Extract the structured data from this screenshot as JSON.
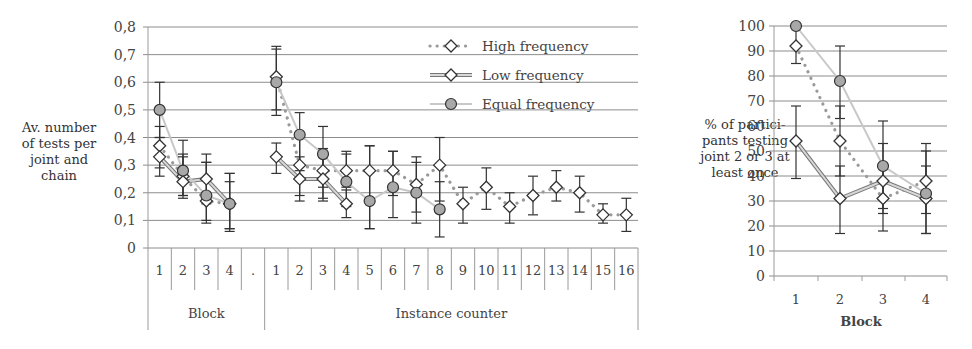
{
  "chart_data": [
    {
      "type": "line",
      "title": "",
      "ylabel": "Av. number of tests per joint and chain",
      "xlabel_groups": [
        "Block",
        "Instance counter"
      ],
      "ylim": [
        0,
        0.8
      ],
      "yticks": [
        "0",
        "0,1",
        "0,2",
        "0,3",
        "0,4",
        "0,5",
        "0,6",
        "0,7",
        "0,8"
      ],
      "categories": [
        "1",
        "2",
        "3",
        "4",
        ".",
        "1",
        "2",
        "3",
        "4",
        "5",
        "6",
        "7",
        "8",
        "9",
        "10",
        "11",
        "12",
        "13",
        "14",
        "15",
        "16"
      ],
      "grid": true,
      "legend_position": "top-right",
      "series": [
        {
          "name": "High frequency",
          "style": "dotted",
          "marker": "diamond",
          "values": [
            0.37,
            0.26,
            0.17,
            0.16,
            null,
            0.62,
            0.3,
            0.28,
            0.28,
            0.28,
            0.28,
            0.23,
            0.3,
            0.16,
            0.22,
            0.15,
            0.19,
            0.22,
            0.2,
            0.12,
            0.12
          ],
          "err_low": [
            0.29,
            0.19,
            0.1,
            0.07,
            null,
            0.5,
            0.19,
            0.22,
            0.22,
            0.07,
            0.19,
            0.13,
            0.17,
            0.09,
            0.14,
            0.09,
            0.12,
            0.17,
            0.13,
            0.09,
            0.06
          ],
          "err_high": [
            0.44,
            0.34,
            0.31,
            0.24,
            null,
            0.73,
            0.41,
            0.36,
            0.35,
            0.37,
            0.35,
            0.33,
            0.4,
            0.22,
            0.29,
            0.2,
            0.26,
            0.28,
            0.26,
            0.16,
            0.18
          ]
        },
        {
          "name": "Low frequency",
          "style": "double",
          "marker": "diamond",
          "values": [
            0.33,
            0.24,
            0.25,
            0.16,
            null,
            0.33,
            0.25,
            0.25,
            0.16
          ],
          "err_low": [
            0.26,
            0.18,
            0.16,
            0.07,
            null,
            0.27,
            0.17,
            0.17,
            0.11
          ],
          "err_high": [
            0.4,
            0.33,
            0.34,
            0.27,
            null,
            0.38,
            0.33,
            0.33,
            0.21
          ]
        },
        {
          "name": "Equal frequency",
          "style": "solid-light",
          "marker": "circle",
          "values": [
            0.5,
            0.28,
            0.19,
            0.16,
            null,
            0.6,
            0.41,
            0.34,
            0.24,
            0.17,
            0.22,
            0.2,
            0.14
          ],
          "err_low": [
            0.4,
            0.19,
            0.09,
            0.06,
            null,
            0.48,
            0.28,
            0.18,
            0.15,
            0.07,
            0.11,
            0.09,
            0.04
          ],
          "err_high": [
            0.6,
            0.39,
            0.31,
            0.27,
            null,
            0.72,
            0.49,
            0.44,
            0.34,
            0.37,
            0.35,
            0.31,
            0.24
          ]
        }
      ]
    },
    {
      "type": "line",
      "title": "",
      "ylabel": "% of partici- pants testing joint 2 or 3 at least once",
      "xlabel": "Block",
      "ylim": [
        0,
        100
      ],
      "yticks": [
        "0",
        "10",
        "20",
        "30",
        "40",
        "50",
        "60",
        "70",
        "80",
        "90",
        "100"
      ],
      "categories": [
        "1",
        "2",
        "3",
        "4"
      ],
      "grid": true,
      "series": [
        {
          "name": "High frequency",
          "style": "dotted",
          "marker": "diamond",
          "values": [
            92,
            54,
            31,
            38
          ],
          "err_low": [
            85,
            40,
            18,
            25
          ],
          "err_high": [
            100,
            68,
            45,
            53
          ]
        },
        {
          "name": "Low frequency",
          "style": "double",
          "marker": "diamond",
          "values": [
            54,
            31,
            38,
            31
          ],
          "err_low": [
            39,
            17,
            25,
            17
          ],
          "err_high": [
            68,
            44,
            53,
            44
          ]
        },
        {
          "name": "Equal frequency",
          "style": "solid-light",
          "marker": "circle",
          "values": [
            100,
            78,
            44,
            33
          ],
          "err_low": [
            100,
            63,
            27,
            17
          ],
          "err_high": [
            100,
            92,
            62,
            50
          ]
        }
      ]
    }
  ],
  "left": {
    "ylabel_lines": [
      "Av. number",
      "of tests per",
      "joint and",
      "chain"
    ],
    "group_block": "Block",
    "group_instance": "Instance counter",
    "legend": [
      "High frequency",
      "Low frequency",
      "Equal frequency"
    ]
  },
  "right": {
    "ylabel_lines": [
      "% of partici-",
      "pants testing",
      "joint 2 or 3 at",
      "least once"
    ],
    "xlabel": "Block"
  },
  "colors": {
    "grid": "#8c8c8c",
    "axis": "#9a9a9a",
    "high": "#9a9a9a",
    "low_outer": "#777777",
    "low_inner": "#d8d8d8",
    "equal_line": "#c8c8c8",
    "equal_marker": "#a8a8a8",
    "marker_stroke": "#333333",
    "errorbar": "#333333"
  }
}
